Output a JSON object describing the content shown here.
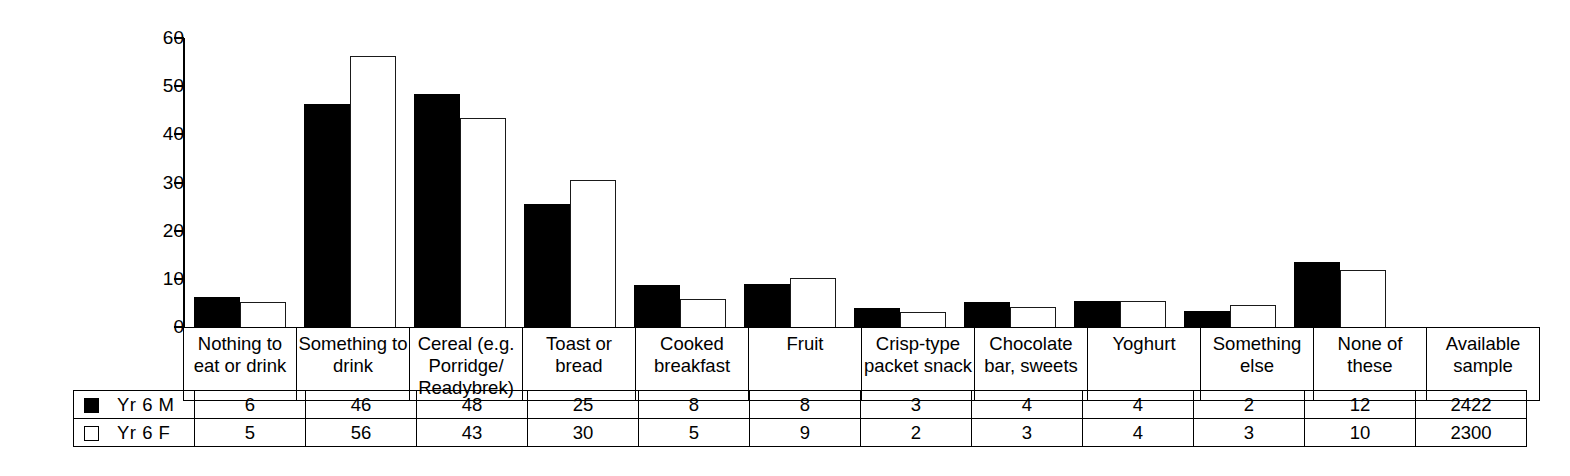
{
  "chart_data": {
    "type": "bar",
    "title": "",
    "xlabel": "",
    "ylabel": "",
    "ylim": [
      0,
      60
    ],
    "yticks": [
      0,
      10,
      20,
      30,
      40,
      50,
      60
    ],
    "grid": false,
    "legend_position": "table-left",
    "categories": [
      "Nothing to eat or drink",
      "Something to drink",
      "Cereal (e.g. Porridge/ Readybrek)",
      "Toast or bread",
      "Cooked breakfast",
      "Fruit",
      "Crisp-type packet snack",
      "Chocolate bar, sweets",
      "Yoghurt",
      "Something else",
      "None of these"
    ],
    "series": [
      {
        "name": "Yr 6 M",
        "color": "#000000",
        "fill": "solid",
        "values": [
          6,
          46,
          48,
          25,
          8,
          8,
          3,
          4,
          4,
          2,
          12
        ],
        "plotted": [
          6.2,
          46.2,
          48.4,
          25.5,
          8.8,
          9.0,
          4.0,
          5.2,
          5.4,
          3.4,
          13.6
        ],
        "available_sample": 2422
      },
      {
        "name": "Yr 6 F",
        "color": "#ffffff",
        "fill": "hollow",
        "values": [
          5,
          56,
          43,
          30,
          5,
          9,
          2,
          3,
          4,
          3,
          10
        ],
        "plotted": [
          5.2,
          56.2,
          43.4,
          30.6,
          5.9,
          10.1,
          3.1,
          4.2,
          5.5,
          4.6,
          11.9
        ],
        "available_sample": 2300
      }
    ]
  },
  "category_table": {
    "labels": [
      [
        "Nothing to",
        "eat or drink"
      ],
      [
        "Something to",
        "drink"
      ],
      [
        "Cereal (e.g.",
        "Porridge/",
        "Readybrek)"
      ],
      [
        "Toast or",
        "bread"
      ],
      [
        "Cooked",
        "breakfast"
      ],
      [
        "Fruit"
      ],
      [
        "Crisp-type",
        "packet snack"
      ],
      [
        "Chocolate",
        "bar, sweets"
      ],
      [
        "Yoghurt"
      ],
      [
        "Something",
        "else"
      ],
      [
        "None of these"
      ],
      [
        "Available",
        "sample"
      ]
    ]
  },
  "data_table": {
    "rows": [
      {
        "legend_label": "Yr 6 M",
        "swatch": "filled-square-icon",
        "values": [
          "6",
          "46",
          "48",
          "25",
          "8",
          "8",
          "3",
          "4",
          "4",
          "2",
          "12",
          "2422"
        ]
      },
      {
        "legend_label": "Yr 6 F",
        "swatch": "hollow-square-icon",
        "values": [
          "5",
          "56",
          "43",
          "30",
          "5",
          "9",
          "2",
          "3",
          "4",
          "3",
          "10",
          "2300"
        ]
      }
    ]
  },
  "axis": {
    "y_labels": [
      "60",
      "50",
      "40",
      "30",
      "20",
      "10",
      "0"
    ]
  }
}
